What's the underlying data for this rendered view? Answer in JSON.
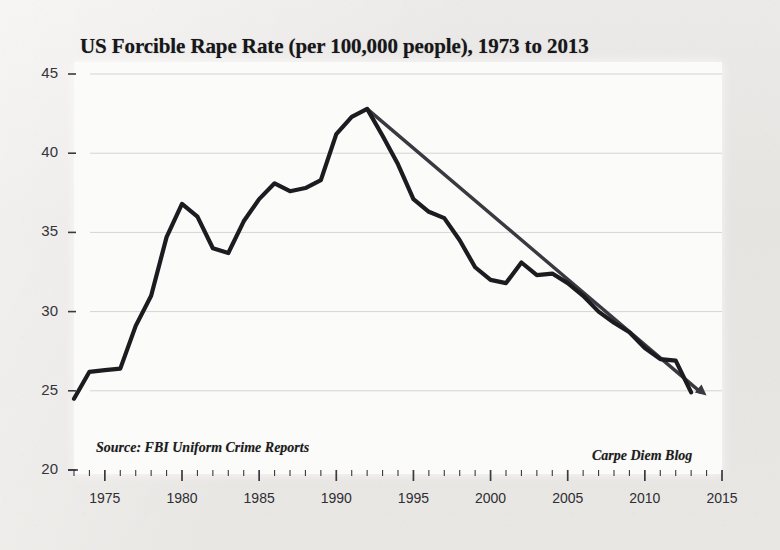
{
  "chart_data": {
    "type": "line",
    "title": "US Forcible Rape Rate (per 100,000 people), 1973 to 2013",
    "xlabel": "",
    "ylabel": "",
    "xlim": [
      1973,
      2015
    ],
    "ylim": [
      20,
      45
    ],
    "grid": true,
    "legend": "none",
    "y_ticks": [
      20,
      25,
      30,
      35,
      40,
      45
    ],
    "x_ticks": [
      1975,
      1980,
      1985,
      1990,
      1995,
      2000,
      2005,
      2010,
      2015
    ],
    "x_minor_tick_interval": 1,
    "series": [
      {
        "name": "US forcible rape rate",
        "color": "#1c1b1f",
        "x": [
          1973,
          1974,
          1975,
          1976,
          1977,
          1978,
          1979,
          1980,
          1981,
          1982,
          1983,
          1984,
          1985,
          1986,
          1987,
          1988,
          1989,
          1990,
          1991,
          1992,
          1993,
          1994,
          1995,
          1996,
          1997,
          1998,
          1999,
          2000,
          2001,
          2002,
          2003,
          2004,
          2005,
          2006,
          2007,
          2008,
          2009,
          2010,
          2011,
          2012,
          2013
        ],
        "values": [
          24.5,
          26.2,
          26.3,
          26.4,
          29.1,
          31.0,
          34.7,
          36.8,
          36.0,
          34.0,
          33.7,
          35.7,
          37.1,
          38.1,
          37.6,
          37.8,
          38.3,
          41.2,
          42.3,
          42.8,
          41.1,
          39.3,
          37.1,
          36.3,
          35.9,
          34.5,
          32.8,
          32.0,
          31.8,
          33.1,
          32.3,
          32.4,
          31.8,
          31.0,
          30.0,
          29.3,
          28.7,
          27.7,
          27.0,
          26.9,
          24.9
        ]
      },
      {
        "name": "trend line 1992 to 2014",
        "color": "#3a3940",
        "style": "arrow",
        "x": [
          1992,
          2014
        ],
        "values": [
          42.8,
          24.7
        ]
      }
    ],
    "annotations": [
      {
        "name": "source",
        "text": "Source: FBI Uniform Crime Reports"
      },
      {
        "name": "credit",
        "text": "Carpe Diem Blog"
      }
    ]
  },
  "labels": {
    "y": [
      "45",
      "40",
      "35",
      "30",
      "25",
      "20"
    ],
    "x": [
      "1975",
      "1980",
      "1985",
      "1990",
      "1995",
      "2000",
      "2005",
      "2010",
      "2015"
    ]
  },
  "notes": {
    "source": "Source: FBI Uniform Crime Reports",
    "credit": "Carpe Diem Blog"
  },
  "colors": {
    "line": "#1c1b1f",
    "trend": "#3a3940",
    "grid": "#d5d4d6",
    "paper": "#e9e8e6",
    "plot_bg": "#fbfbfa"
  }
}
